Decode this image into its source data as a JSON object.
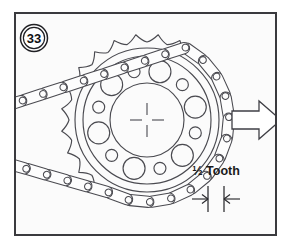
{
  "figure": {
    "number_badge": "33",
    "caption_label": "½ Tooth",
    "direction_arrow_name": "right-arrow",
    "background_color": "#fbfbfb",
    "border_color": "#3a3a3e",
    "line_color": "#4a4a50",
    "text_color": "#1a1a1a"
  },
  "sprocket": {
    "center_x": 147,
    "center_y": 120,
    "tooth_tip_radius": 86,
    "root_radius": 78,
    "rim_radius": 72,
    "web_outer_radius": 64,
    "hub_radius": 37,
    "tooth_count": 24,
    "large_hole_count": 6,
    "large_hole_radius": 11,
    "large_hole_orbit": 50,
    "small_hole_count": 6,
    "small_hole_radius": 6,
    "small_hole_orbit": 50,
    "center_mark": "crosshair"
  },
  "chain": {
    "type": "roller-chain",
    "wrap_start_deg": -62,
    "wrap_end_deg": 118,
    "link_pitch_deg": 15,
    "roller_radius": 3.4,
    "plate_half_width": 5.6,
    "pitch_radius": 82,
    "free_run_top_label": "chain-run-upper",
    "free_run_bottom_label": "chain-run-lower"
  },
  "dimension": {
    "label": "½ Tooth",
    "tick_left_x": 208,
    "tick_right_x": 224,
    "tick_top_y": 186,
    "tick_bottom_y": 212,
    "arrow_direction": "inward"
  },
  "direction_arrow": {
    "tip_x": 281,
    "tail_x": 232,
    "center_y": 120,
    "shaft_half_height": 9,
    "head_half_height": 19
  }
}
